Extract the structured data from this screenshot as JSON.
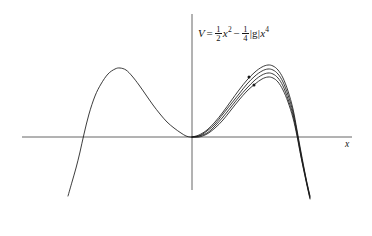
{
  "figure": {
    "title_formula": {
      "lhs": "V",
      "equals": "=",
      "term1_num": "1",
      "term1_den": "2",
      "term1_var": "x",
      "term1_exp": "2",
      "minus": "−",
      "term2_num": "1",
      "term2_den": "4",
      "term2_coupling": "|g|",
      "term2_var": "x",
      "term2_exp": "4",
      "plain": "V = 1/2 x^2 - 1/4 |g| x^4"
    },
    "axis_x_label": "x",
    "stroke_color": "#1a1a1a",
    "axis_color": "#555555",
    "background_color": "#ffffff"
  },
  "chart_data": {
    "type": "line",
    "xlabel": "x",
    "ylabel": "V",
    "grid": false,
    "legend": false,
    "axis_origin_px": {
      "x": 192,
      "y": 137
    },
    "x_axis_px": {
      "x_start": 22,
      "x_end": 352,
      "y": 137
    },
    "y_axis_px": {
      "y_start": 14,
      "y_end": 190,
      "x": 192
    },
    "xlim": [
      -2.6,
      2.6
    ],
    "ylim": [
      -1.1,
      1.1
    ],
    "annotations": [
      {
        "label": "marker-dot",
        "x_px": 249,
        "y_px": 77
      },
      {
        "label": "marker-dot",
        "x_px": 254,
        "y_px": 85
      }
    ],
    "series": [
      {
        "name": "left-branch",
        "comment": "single curve on negative x side",
        "points_px": [
          [
            68,
            196
          ],
          [
            72,
            182
          ],
          [
            76,
            168
          ],
          [
            80,
            152
          ],
          [
            84,
            134
          ],
          [
            89,
            114
          ],
          [
            95,
            96
          ],
          [
            101,
            84
          ],
          [
            108,
            74
          ],
          [
            115,
            69
          ],
          [
            120,
            68
          ],
          [
            126,
            70
          ],
          [
            132,
            76
          ],
          [
            139,
            85
          ],
          [
            146,
            95
          ],
          [
            153,
            105
          ],
          [
            160,
            114
          ],
          [
            167,
            122
          ],
          [
            174,
            128
          ],
          [
            181,
            133
          ],
          [
            186,
            136
          ],
          [
            190,
            137
          ],
          [
            192,
            137
          ]
        ]
      },
      {
        "name": "right-branch-curve-1",
        "comment": "outermost of the overlapping right-side curves",
        "points_px": [
          [
            192,
            137
          ],
          [
            199,
            135
          ],
          [
            207,
            130
          ],
          [
            215,
            122
          ],
          [
            223,
            112
          ],
          [
            231,
            101
          ],
          [
            239,
            90
          ],
          [
            247,
            80
          ],
          [
            255,
            72
          ],
          [
            262,
            67
          ],
          [
            268,
            65
          ],
          [
            273,
            66
          ],
          [
            278,
            70
          ],
          [
            283,
            78
          ],
          [
            288,
            91
          ],
          [
            293,
            109
          ],
          [
            297,
            130
          ],
          [
            301,
            152
          ],
          [
            306,
            178
          ],
          [
            310,
            196
          ]
        ]
      },
      {
        "name": "right-branch-curve-2",
        "comment": "second overlapping right-side curve, slightly lower peak",
        "points_px": [
          [
            192,
            137
          ],
          [
            199,
            136
          ],
          [
            207,
            131
          ],
          [
            215,
            124
          ],
          [
            223,
            114
          ],
          [
            231,
            104
          ],
          [
            239,
            94
          ],
          [
            247,
            84
          ],
          [
            255,
            76
          ],
          [
            262,
            71
          ],
          [
            268,
            69
          ],
          [
            273,
            70
          ],
          [
            278,
            74
          ],
          [
            283,
            82
          ],
          [
            288,
            95
          ],
          [
            293,
            112
          ],
          [
            297,
            132
          ],
          [
            301,
            154
          ],
          [
            306,
            179
          ],
          [
            310,
            197
          ]
        ]
      },
      {
        "name": "right-branch-curve-3",
        "comment": "third overlapping right-side curve",
        "points_px": [
          [
            192,
            137
          ],
          [
            199,
            136
          ],
          [
            207,
            133
          ],
          [
            215,
            126
          ],
          [
            223,
            117
          ],
          [
            231,
            107
          ],
          [
            239,
            97
          ],
          [
            247,
            88
          ],
          [
            255,
            80
          ],
          [
            262,
            75
          ],
          [
            268,
            73
          ],
          [
            273,
            74
          ],
          [
            278,
            78
          ],
          [
            283,
            86
          ],
          [
            288,
            99
          ],
          [
            293,
            115
          ],
          [
            297,
            134
          ],
          [
            301,
            156
          ],
          [
            306,
            180
          ],
          [
            310,
            198
          ]
        ]
      },
      {
        "name": "right-branch-curve-4",
        "comment": "innermost overlapping right-side curve, lowest peak",
        "points_px": [
          [
            192,
            137
          ],
          [
            199,
            137
          ],
          [
            207,
            134
          ],
          [
            215,
            128
          ],
          [
            223,
            120
          ],
          [
            231,
            110
          ],
          [
            239,
            100
          ],
          [
            247,
            91
          ],
          [
            255,
            84
          ],
          [
            262,
            79
          ],
          [
            268,
            77
          ],
          [
            273,
            78
          ],
          [
            278,
            82
          ],
          [
            283,
            90
          ],
          [
            288,
            102
          ],
          [
            293,
            118
          ],
          [
            297,
            136
          ],
          [
            301,
            157
          ],
          [
            306,
            181
          ],
          [
            310,
            199
          ]
        ]
      }
    ]
  }
}
